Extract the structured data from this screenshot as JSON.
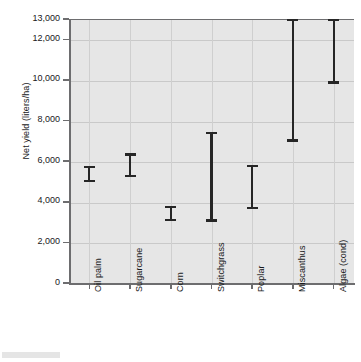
{
  "chart_data": {
    "type": "bar",
    "subtype": "range-interval",
    "title": "",
    "xlabel": "",
    "ylabel": "Net yield (liters/ha)",
    "ylim": [
      0,
      13000
    ],
    "grid": true,
    "legend": false,
    "categories": [
      "Oil palm",
      "Sugarcane",
      "Corn",
      "Switchgrass",
      "Poplar",
      "Miscanthus",
      "Algae (cond)"
    ],
    "ytick_values": [
      0,
      2000,
      4000,
      6000,
      8000,
      10000,
      12000,
      13000
    ],
    "ytick_labels": [
      "0",
      "2,000",
      "4,000",
      "6,000",
      "8,000",
      "10,000",
      "12,000",
      "13,000"
    ],
    "series": [
      {
        "name": "Net yield range",
        "low": [
          4950,
          5200,
          3050,
          3020,
          3620,
          6950,
          9820
        ],
        "high": [
          5780,
          6380,
          3800,
          7450,
          5830,
          13000,
          13000
        ]
      }
    ],
    "points": [
      {
        "category": "Oil palm",
        "low": 4950,
        "high": 5780
      },
      {
        "category": "Sugarcane",
        "low": 5200,
        "high": 6380
      },
      {
        "category": "Corn",
        "low": 3050,
        "high": 3800
      },
      {
        "category": "Switchgrass",
        "low": 3020,
        "high": 7450
      },
      {
        "category": "Poplar",
        "low": 3620,
        "high": 5830
      },
      {
        "category": "Miscanthus",
        "low": 6950,
        "high": 13000
      },
      {
        "category": "Algae (cond)",
        "low": 9820,
        "high": 13000
      }
    ],
    "colors": {
      "marker": "#262626",
      "plot_background": "#e6e6e6",
      "gridline": "#c9c9c9",
      "axis": "#6d6d6f",
      "text": "#19191b",
      "figure_background": "#ffffff"
    }
  }
}
